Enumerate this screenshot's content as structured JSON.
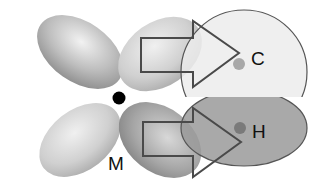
{
  "diagram": {
    "labels": {
      "metal": "M",
      "carbon": "C",
      "hydrogen": "H"
    },
    "colors": {
      "lobe_dark": "#8f8f8f",
      "lobe_light": "#dcdcdc",
      "bond_upper_fill": "#ececec",
      "bond_lower_fill": "#9a9a9a",
      "outline": "#555555",
      "metal_dot": "#000000",
      "atom_dot_c": "#a8a8a8",
      "atom_dot_h": "#7a7a7a"
    }
  }
}
